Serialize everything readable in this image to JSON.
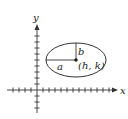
{
  "diagram": {
    "axes": {
      "x_label": "x",
      "y_label": "y"
    },
    "ellipse": {
      "semi_major_label": "a",
      "semi_minor_label": "b",
      "center_label": "(h, k)"
    },
    "colors": {
      "stroke": "#333333",
      "text": "#222222",
      "background": "#ffffff"
    }
  }
}
